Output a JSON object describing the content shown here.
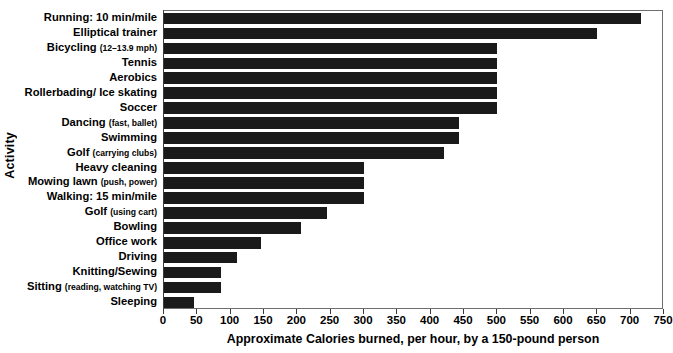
{
  "chart_data": {
    "type": "bar",
    "orientation": "horizontal",
    "title": "",
    "xlabel": "Approximate Calories burned, per hour, by a 150-pound person",
    "ylabel": "Activity",
    "xlim": [
      0,
      750
    ],
    "xticks": [
      0,
      50,
      100,
      150,
      200,
      250,
      300,
      350,
      400,
      450,
      500,
      550,
      600,
      650,
      700,
      750
    ],
    "grid": false,
    "legend": null,
    "categories": [
      "Running: 10 min/mile",
      "Elliptical trainer",
      "Bicycling (12–13.9 mph)",
      "Tennis",
      "Aerobics",
      "Rollerbading/ Ice skating",
      "Soccer",
      "Dancing (fast, ballet)",
      "Swimming",
      "Golf (carrying clubs)",
      "Heavy cleaning",
      "Mowing lawn (push, power)",
      "Walking: 15 min/mile",
      "Golf (using cart)",
      "Bowling",
      "Office work",
      "Driving",
      "Knitting/Sewing",
      "Sitting (reading, watching TV)",
      "Sleeping"
    ],
    "values": [
      715,
      650,
      500,
      500,
      500,
      500,
      500,
      443,
      443,
      420,
      300,
      300,
      300,
      245,
      205,
      145,
      110,
      85,
      85,
      45
    ],
    "bar_color": "#1a1a1a"
  },
  "labels": [
    {
      "main": "Running: 10 min/mile",
      "sub": ""
    },
    {
      "main": "Elliptical trainer",
      "sub": ""
    },
    {
      "main": "Bicycling ",
      "sub": "(12–13.9 mph)"
    },
    {
      "main": "Tennis",
      "sub": ""
    },
    {
      "main": "Aerobics",
      "sub": ""
    },
    {
      "main": "Rollerbading/ Ice skating",
      "sub": ""
    },
    {
      "main": "Soccer",
      "sub": ""
    },
    {
      "main": "Dancing ",
      "sub": "(fast, ballet)"
    },
    {
      "main": "Swimming",
      "sub": ""
    },
    {
      "main": "Golf ",
      "sub": "(carrying clubs)"
    },
    {
      "main": "Heavy cleaning",
      "sub": ""
    },
    {
      "main": "Mowing lawn ",
      "sub": "(push, power)"
    },
    {
      "main": "Walking: 15 min/mile",
      "sub": ""
    },
    {
      "main": "Golf ",
      "sub": "(using cart)"
    },
    {
      "main": "Bowling",
      "sub": ""
    },
    {
      "main": "Office work",
      "sub": ""
    },
    {
      "main": "Driving",
      "sub": ""
    },
    {
      "main": "Knitting/Sewing",
      "sub": ""
    },
    {
      "main": "Sitting ",
      "sub": "(reading, watching TV)"
    },
    {
      "main": "Sleeping",
      "sub": ""
    }
  ]
}
